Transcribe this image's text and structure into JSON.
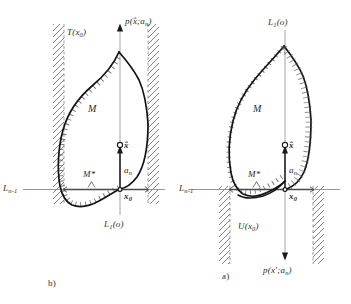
{
  "figure": {
    "type": "mathematical-diagram",
    "background_color": "#ffffff",
    "line_color": "#1a1a1a",
    "thin_line_color": "#888888",
    "hatch_color": "#555555"
  },
  "panels": [
    {
      "id": "b",
      "caption": "b)",
      "labels": {
        "tangent_cone": "T(x",
        "tangent_cone_sub": "0",
        "tangent_cone_end": ")",
        "set": "M",
        "set_star": "M*",
        "point_hat": "x̂",
        "point_origin": "x",
        "point_origin_sub": "0",
        "direction": "a",
        "direction_sub": "n",
        "axis_vertical": "L",
        "axis_vertical_sub": "1",
        "axis_vertical_end": "(o)",
        "axis_horizontal": "L",
        "axis_horizontal_sub": "n-1",
        "support_function": "p(x̂;a",
        "support_function_sub": "n",
        "support_function_end": ")"
      }
    },
    {
      "id": "a",
      "caption": "a)",
      "labels": {
        "upper_set": "U(x",
        "upper_set_sub": "0",
        "upper_set_end": ")",
        "set": "M",
        "set_star": "M*",
        "point_hat": "x̂",
        "point_origin": "x",
        "point_origin_sub": "0",
        "direction": "a",
        "direction_sub": "n",
        "axis_vertical": "L",
        "axis_vertical_sub": "1",
        "axis_vertical_end": "(o)",
        "axis_horizontal": "L",
        "axis_horizontal_sub": "n-1",
        "support_function": "p(x';a",
        "support_function_sub": "n",
        "support_function_end": ")"
      }
    }
  ]
}
